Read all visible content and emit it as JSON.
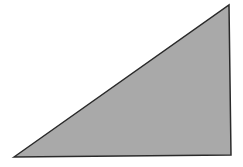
{
  "diagram": {
    "shape": "right-triangle",
    "fill": "#a9a9a9",
    "stroke": "#2a2a2a",
    "vertices": [
      [
        14,
        157
      ],
      [
        229,
        5
      ],
      [
        231,
        155
      ]
    ]
  }
}
